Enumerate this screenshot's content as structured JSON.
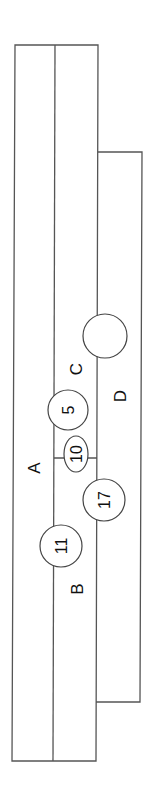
{
  "diagram": {
    "type": "section-layout",
    "orientation": "rotated-90-ccw",
    "colors": {
      "line": "#555555",
      "text": "#111111",
      "background": "#ffffff"
    },
    "regions": [
      {
        "id": "A",
        "label": "A"
      },
      {
        "id": "B",
        "label": "B"
      },
      {
        "id": "C",
        "label": "C"
      },
      {
        "id": "D",
        "label": "D"
      }
    ],
    "markers": [
      {
        "id": "m5",
        "label": "5",
        "shape": "circle"
      },
      {
        "id": "m10",
        "label": "10",
        "shape": "ellipse"
      },
      {
        "id": "m11",
        "label": "11",
        "shape": "circle"
      },
      {
        "id": "m17",
        "label": "17",
        "shape": "circle"
      },
      {
        "id": "mEmpty",
        "label": "",
        "shape": "circle"
      }
    ]
  }
}
